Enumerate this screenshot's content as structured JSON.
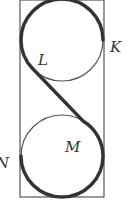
{
  "diagram": {
    "type": "figure-eight track in rectangle",
    "labels": {
      "K": "K",
      "L": "L",
      "M": "M",
      "N": "N"
    },
    "colors": {
      "thin_line": "#555555",
      "thick_path": "#333333",
      "background": "#ffffff"
    }
  }
}
